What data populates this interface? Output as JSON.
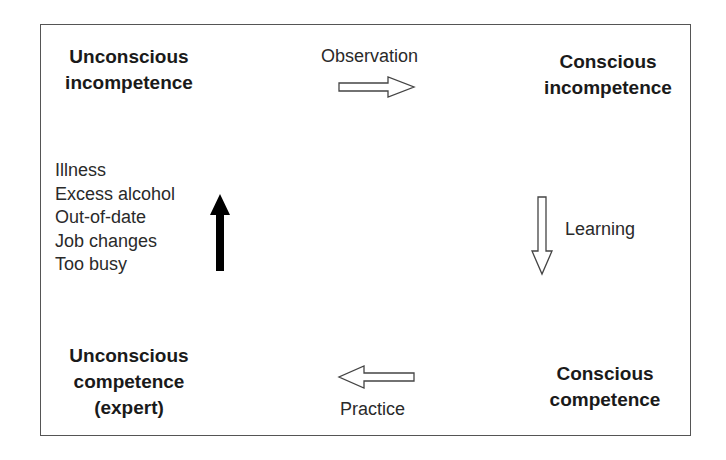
{
  "diagram": {
    "stages": {
      "top_left": {
        "line1": "Unconscious",
        "line2": "incompetence"
      },
      "top_right": {
        "line1": "Conscious",
        "line2": "incompetence"
      },
      "bottom_right": {
        "line1": "Conscious",
        "line2": "competence"
      },
      "bottom_left": {
        "line1": "Unconscious",
        "line2": "competence",
        "line3": "(expert)"
      }
    },
    "transitions": {
      "observation": "Observation",
      "learning": "Learning",
      "practice": "Practice"
    },
    "regression_factors": [
      "Illness",
      "Excess alcohol",
      "Out-of-date",
      "Job changes",
      "Too busy"
    ],
    "colors": {
      "text": "#1a1a1a",
      "border": "#555555",
      "hollow_arrow_stroke": "#444444",
      "solid_arrow_fill": "#000000",
      "background": "#ffffff"
    }
  }
}
